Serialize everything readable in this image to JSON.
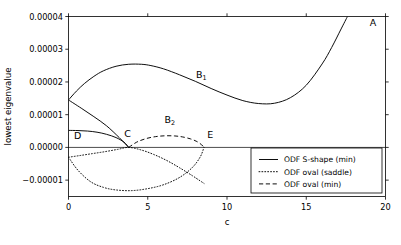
{
  "chart_data": {
    "type": "line",
    "title": "",
    "xlabel": "c",
    "ylabel": "lowest eigenvalue",
    "xlim": [
      0,
      20
    ],
    "ylim": [
      -1.5e-05,
      4e-05
    ],
    "grid": false,
    "xticks": [
      0,
      5,
      10,
      15,
      20
    ],
    "xtick_labels": [
      "0",
      "5",
      "10",
      "15",
      "20"
    ],
    "yticks": [
      -1e-05,
      0.0,
      1e-05,
      2e-05,
      3e-05,
      4e-05
    ],
    "ytick_labels": [
      "−0.00001",
      "0.00000",
      "0.00001",
      "0.00002",
      "0.00003",
      "0.00004"
    ],
    "legend_position": "lower right",
    "zero_reference_line": 0.0,
    "series": [
      {
        "name": "ODF S-shape (min)",
        "style": "solid",
        "color": "#000000",
        "branches": [
          {
            "branch_name": "upper-A-branch",
            "x": [
              0.0,
              0.5,
              1.0,
              1.6,
              2.2,
              3.0,
              3.8,
              4.6,
              5.2,
              6.0,
              7.0,
              8.0,
              9.0,
              10.0,
              11.0,
              12.0,
              13.0,
              14.0,
              15.0,
              16.0,
              16.6,
              17.2,
              17.6
            ],
            "y": [
              1.45e-05,
              1.72e-05,
              1.95e-05,
              2.17e-05,
              2.34e-05,
              2.48e-05,
              2.54e-05,
              2.54e-05,
              2.5e-05,
              2.4e-05,
              2.22e-05,
              2.02e-05,
              1.8e-05,
              1.6e-05,
              1.43e-05,
              1.34e-05,
              1.35e-05,
              1.52e-05,
              1.9e-05,
              2.55e-05,
              3.05e-05,
              3.62e-05,
              4e-05
            ]
          },
          {
            "branch_name": "lower-C-branch",
            "x": [
              0.0,
              0.8,
              1.6,
              2.4,
              3.2,
              3.8
            ],
            "y": [
              1.45e-05,
              1.2e-05,
              9.4e-06,
              6.6e-06,
              3e-06,
              0.0
            ]
          },
          {
            "branch_name": "D-branch",
            "x": [
              0.0,
              0.6,
              1.2,
              1.8,
              2.4,
              3.0,
              3.5,
              3.8
            ],
            "y": [
              5.2e-06,
              5.15e-06,
              5e-06,
              4.65e-06,
              4e-06,
              3e-06,
              1.6e-06,
              0.0
            ]
          }
        ]
      },
      {
        "name": "ODF oval (saddle)",
        "style": "dotted",
        "color": "#000000",
        "branches": [
          {
            "branch_name": "oval-lower-arc",
            "x": [
              0.0,
              0.6,
              1.4,
              2.2,
              3.0,
              4.0,
              5.0,
              6.0,
              7.0,
              7.8,
              8.3,
              8.55
            ],
            "y": [
              -3e-06,
              -7e-06,
              -1.05e-05,
              -1.22e-05,
              -1.3e-05,
              -1.32e-05,
              -1.26e-05,
              -1.14e-05,
              -9.2e-06,
              -6.2e-06,
              -3e-06,
              0.0
            ]
          },
          {
            "branch_name": "oval-upper-arc",
            "x": [
              0.0,
              0.7,
              1.5,
              2.3,
              3.1,
              3.8,
              4.6,
              5.4,
              6.2,
              7.0,
              7.8,
              8.3,
              8.55
            ],
            "y": [
              -3e-06,
              -2.5e-06,
              -1.9e-06,
              -1.3e-06,
              -6e-07,
              0.0,
              -8e-07,
              -2.2e-06,
              -4e-06,
              -6.2e-06,
              -8.6e-06,
              -1.02e-05,
              -1.1e-05
            ]
          }
        ]
      },
      {
        "name": "ODF oval (min)",
        "style": "dashed",
        "color": "#000000",
        "branches": [
          {
            "branch_name": "C-to-E-arc",
            "x": [
              3.8,
              4.3,
              4.9,
              5.5,
              6.1,
              6.7,
              7.2,
              7.7,
              8.1,
              8.4,
              8.55
            ],
            "y": [
              0.0,
              1.6e-06,
              2.7e-06,
              3.3e-06,
              3.55e-06,
              3.5e-06,
              3.2e-06,
              2.6e-06,
              1.8e-06,
              8e-07,
              0.0
            ]
          }
        ]
      }
    ],
    "annotations": [
      {
        "label": "A",
        "sub": "",
        "x": 19.0,
        "y": 3.7e-05
      },
      {
        "label": "B",
        "sub": "1",
        "x": 8.05,
        "y": 2.12e-05
      },
      {
        "label": "B",
        "sub": "2",
        "x": 6.05,
        "y": 7.4e-06
      },
      {
        "label": "C",
        "sub": "",
        "x": 3.52,
        "y": 3.3e-06
      },
      {
        "label": "D",
        "sub": "",
        "x": 0.35,
        "y": 2.6e-06
      },
      {
        "label": "E",
        "sub": "",
        "x": 8.75,
        "y": 3e-06
      }
    ]
  },
  "legend": {
    "items": [
      {
        "label": "ODF S-shape (min)",
        "style": "solid"
      },
      {
        "label": "ODF oval (saddle)",
        "style": "dotted"
      },
      {
        "label": "ODF oval (min)",
        "style": "dashed"
      }
    ]
  }
}
